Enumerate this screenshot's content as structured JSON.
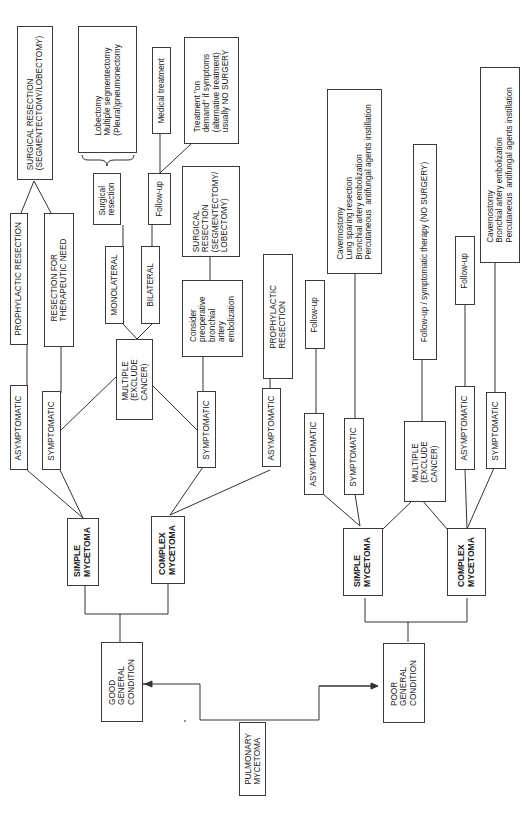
{
  "diagram": {
    "root": "PULMONARY\nMYCETOMA",
    "good_condition": {
      "label": "GOOD\nGENERAL\nCONDITION",
      "simple": {
        "label": "SIMPLE\nMYCETOMA",
        "asymptomatic": "ASYMPTOMATIC",
        "asymptomatic_action": "PROPHYLACTIC RESECTION",
        "symptomatic": "SYMPTOMATIC",
        "symptomatic_action": "RESECTION FOR\nTHERAPEUTIC NEED",
        "shared_outcome": "SURGICAL RESECTION\n(SEGMENTECTOMY/LOBECTOMY)"
      },
      "multiple": {
        "label": "MULTIPLE\n(EXCLUDE\nCANCER)",
        "monolateral": "MONOLATERAL",
        "monolateral_action": "Surgical\nresection",
        "monolateral_options": "Lobectomy\nMultiple segmentectomy\n(Pleural)pneumonectomy",
        "bilateral": "BILATERAL",
        "bilateral_action": "Follow-up",
        "bilateral_option_1": "Medical treatment",
        "bilateral_option_2": "Treatment \"on\ndemand\" if symptoms\n(alternative treatment)\nusually NO SURGERY"
      },
      "complex": {
        "label": "COMPLEX\nMYCETOMA",
        "symptomatic": "SYMPTOMATIC",
        "symptomatic_action": "Consider\npreoperative\nbronchial\nartery\nembolization",
        "symptomatic_outcome": "SURGICAL\nRESECTION\n(SEGMENTECTOMY/\nLOBECTOMY)",
        "asymptomatic": "ASYMPTOMATIC",
        "asymptomatic_action": "PROPHYLACTIC\nRESECTION"
      }
    },
    "poor_condition": {
      "label": "POOR\nGENERAL\nCONDITION",
      "simple": {
        "label": "SIMPLE\nMYCETOMA",
        "asymptomatic": "ASYMPTOMATIC",
        "asymptomatic_action": "Follow-up",
        "symptomatic": "SYMPTOMATIC",
        "symptomatic_action": "Cavernostomy\nLung sparing resection\nBronchial artery embolization\nPercutaneous  antifungal agents instillation"
      },
      "multiple": {
        "label": "MULTIPLE\n(EXCLUDE\nCANCER)",
        "action": "Follow-up / symptomatic therapy (NO SURGERY)"
      },
      "complex": {
        "label": "COMPLEX\nMYCETOMA",
        "asymptomatic": "ASYMPTOMATIC",
        "asymptomatic_action": "Follow-up",
        "symptomatic": "SYMPTOMATIC",
        "symptomatic_action": "Cavernostomy\nBronchial artery embolization\nPercutaneous  antifungal agents instillation"
      }
    }
  }
}
